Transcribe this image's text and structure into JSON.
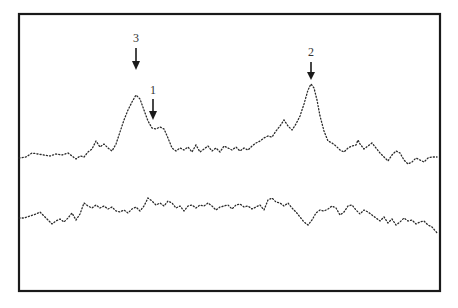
{
  "chart_data": {
    "type": "line",
    "title": "",
    "xlabel": "",
    "ylabel": "",
    "grid": false,
    "legend": null,
    "style": "dotted traces inside rectangular frame, no axis ticks or tick labels",
    "frame": {
      "x": 19,
      "y": 14,
      "width": 421,
      "height": 277
    },
    "annotations": [
      {
        "label": "3",
        "x": 136,
        "label_y": 42,
        "arrow_from": 48,
        "arrow_to": 70,
        "target": "upper trace main peak"
      },
      {
        "label": "1",
        "x": 153,
        "label_y": 94,
        "arrow_from": 99,
        "arrow_to": 120,
        "target": "upper trace shoulder"
      },
      {
        "label": "2",
        "x": 311,
        "label_y": 56,
        "arrow_from": 62,
        "arrow_to": 80,
        "target": "upper trace second peak"
      }
    ],
    "series": [
      {
        "name": "upper trace",
        "points": [
          [
            19,
            158
          ],
          [
            26,
            157
          ],
          [
            32,
            153
          ],
          [
            38,
            154
          ],
          [
            44,
            155
          ],
          [
            50,
            156
          ],
          [
            56,
            154
          ],
          [
            62,
            155
          ],
          [
            68,
            153
          ],
          [
            72,
            156
          ],
          [
            76,
            159
          ],
          [
            80,
            156
          ],
          [
            84,
            157
          ],
          [
            88,
            152
          ],
          [
            92,
            149
          ],
          [
            96,
            141
          ],
          [
            100,
            147
          ],
          [
            104,
            144
          ],
          [
            108,
            148
          ],
          [
            112,
            151
          ],
          [
            116,
            144
          ],
          [
            120,
            132
          ],
          [
            124,
            120
          ],
          [
            128,
            110
          ],
          [
            132,
            102
          ],
          [
            136,
            95
          ],
          [
            140,
            99
          ],
          [
            144,
            110
          ],
          [
            148,
            121
          ],
          [
            152,
            128
          ],
          [
            156,
            129
          ],
          [
            160,
            127
          ],
          [
            164,
            129
          ],
          [
            168,
            138
          ],
          [
            172,
            148
          ],
          [
            176,
            151
          ],
          [
            180,
            148
          ],
          [
            184,
            150
          ],
          [
            188,
            147
          ],
          [
            192,
            152
          ],
          [
            196,
            145
          ],
          [
            200,
            152
          ],
          [
            204,
            149
          ],
          [
            208,
            146
          ],
          [
            212,
            151
          ],
          [
            216,
            148
          ],
          [
            220,
            152
          ],
          [
            224,
            146
          ],
          [
            228,
            148
          ],
          [
            232,
            150
          ],
          [
            236,
            147
          ],
          [
            240,
            151
          ],
          [
            244,
            148
          ],
          [
            248,
            150
          ],
          [
            252,
            146
          ],
          [
            256,
            143
          ],
          [
            260,
            141
          ],
          [
            264,
            138
          ],
          [
            268,
            136
          ],
          [
            272,
            137
          ],
          [
            276,
            131
          ],
          [
            280,
            126
          ],
          [
            284,
            120
          ],
          [
            288,
            126
          ],
          [
            292,
            130
          ],
          [
            296,
            124
          ],
          [
            300,
            116
          ],
          [
            304,
            104
          ],
          [
            308,
            90
          ],
          [
            311,
            84
          ],
          [
            314,
            88
          ],
          [
            317,
            100
          ],
          [
            320,
            116
          ],
          [
            324,
            131
          ],
          [
            328,
            141
          ],
          [
            332,
            143
          ],
          [
            336,
            146
          ],
          [
            340,
            150
          ],
          [
            344,
            152
          ],
          [
            348,
            148
          ],
          [
            352,
            146
          ],
          [
            356,
            145
          ],
          [
            358,
            140
          ],
          [
            360,
            144
          ],
          [
            364,
            149
          ],
          [
            368,
            146
          ],
          [
            372,
            143
          ],
          [
            376,
            148
          ],
          [
            380,
            153
          ],
          [
            384,
            157
          ],
          [
            388,
            161
          ],
          [
            392,
            155
          ],
          [
            396,
            151
          ],
          [
            400,
            153
          ],
          [
            404,
            160
          ],
          [
            408,
            164
          ],
          [
            412,
            162
          ],
          [
            416,
            158
          ],
          [
            420,
            160
          ],
          [
            424,
            162
          ],
          [
            428,
            158
          ],
          [
            432,
            157
          ],
          [
            437,
            157
          ]
        ]
      },
      {
        "name": "lower trace",
        "points": [
          [
            19,
            218
          ],
          [
            24,
            218
          ],
          [
            30,
            216
          ],
          [
            36,
            214
          ],
          [
            40,
            212
          ],
          [
            44,
            216
          ],
          [
            48,
            220
          ],
          [
            52,
            224
          ],
          [
            56,
            221
          ],
          [
            60,
            219
          ],
          [
            64,
            222
          ],
          [
            68,
            218
          ],
          [
            72,
            213
          ],
          [
            76,
            220
          ],
          [
            80,
            214
          ],
          [
            84,
            203
          ],
          [
            88,
            206
          ],
          [
            92,
            208
          ],
          [
            96,
            205
          ],
          [
            100,
            208
          ],
          [
            104,
            206
          ],
          [
            108,
            209
          ],
          [
            112,
            207
          ],
          [
            116,
            211
          ],
          [
            120,
            212
          ],
          [
            124,
            210
          ],
          [
            128,
            213
          ],
          [
            132,
            209
          ],
          [
            136,
            207
          ],
          [
            140,
            211
          ],
          [
            144,
            206
          ],
          [
            148,
            198
          ],
          [
            152,
            201
          ],
          [
            156,
            205
          ],
          [
            160,
            203
          ],
          [
            164,
            206
          ],
          [
            168,
            201
          ],
          [
            172,
            203
          ],
          [
            176,
            208
          ],
          [
            180,
            206
          ],
          [
            184,
            211
          ],
          [
            188,
            206
          ],
          [
            192,
            205
          ],
          [
            196,
            208
          ],
          [
            200,
            205
          ],
          [
            204,
            206
          ],
          [
            208,
            203
          ],
          [
            212,
            206
          ],
          [
            216,
            210
          ],
          [
            220,
            207
          ],
          [
            224,
            206
          ],
          [
            228,
            205
          ],
          [
            232,
            209
          ],
          [
            236,
            205
          ],
          [
            240,
            204
          ],
          [
            244,
            207
          ],
          [
            248,
            206
          ],
          [
            252,
            209
          ],
          [
            256,
            207
          ],
          [
            260,
            205
          ],
          [
            264,
            210
          ],
          [
            268,
            200
          ],
          [
            272,
            198
          ],
          [
            276,
            202
          ],
          [
            280,
            203
          ],
          [
            284,
            206
          ],
          [
            288,
            203
          ],
          [
            292,
            208
          ],
          [
            296,
            212
          ],
          [
            300,
            217
          ],
          [
            304,
            222
          ],
          [
            308,
            225
          ],
          [
            312,
            220
          ],
          [
            316,
            213
          ],
          [
            320,
            210
          ],
          [
            324,
            211
          ],
          [
            328,
            209
          ],
          [
            332,
            206
          ],
          [
            336,
            208
          ],
          [
            340,
            215
          ],
          [
            344,
            212
          ],
          [
            348,
            206
          ],
          [
            352,
            205
          ],
          [
            356,
            210
          ],
          [
            360,
            214
          ],
          [
            364,
            210
          ],
          [
            368,
            212
          ],
          [
            372,
            215
          ],
          [
            376,
            218
          ],
          [
            380,
            221
          ],
          [
            384,
            217
          ],
          [
            388,
            223
          ],
          [
            392,
            219
          ],
          [
            396,
            225
          ],
          [
            400,
            222
          ],
          [
            404,
            218
          ],
          [
            408,
            221
          ],
          [
            412,
            220
          ],
          [
            416,
            224
          ],
          [
            420,
            222
          ],
          [
            424,
            221
          ],
          [
            428,
            225
          ],
          [
            432,
            227
          ],
          [
            438,
            234
          ]
        ]
      }
    ]
  },
  "figure": {
    "peak_labels": [
      "3",
      "1",
      "2"
    ],
    "colors": {
      "ink": "#1a1a1a",
      "trace": "#2a2a2a",
      "background": "#ffffff",
      "label": "#333333"
    }
  }
}
